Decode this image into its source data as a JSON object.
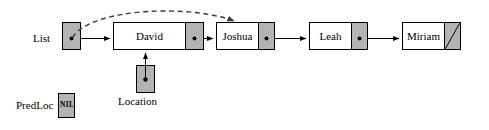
{
  "diagram": {
    "colors": {
      "fill_gray": "#b3b3b3",
      "fill_white": "#ffffff",
      "stroke": "#000000",
      "stroke_gray": "#555555",
      "background": "#ffffff"
    },
    "external_pointers": [
      {
        "id": "list",
        "label": "List",
        "value": "",
        "points_to": "david",
        "dashed_points_to": "joshua"
      },
      {
        "id": "predloc",
        "label": "PredLoc",
        "value": "NIL",
        "points_to": null
      },
      {
        "id": "location",
        "label": "Location",
        "value": "",
        "points_to": "david"
      }
    ],
    "nodes": [
      {
        "id": "david",
        "label": "David",
        "next": "joshua",
        "next_is_null": false
      },
      {
        "id": "joshua",
        "label": "Joshua",
        "next": "leah",
        "next_is_null": false
      },
      {
        "id": "leah",
        "label": "Leah",
        "next": "miriam",
        "next_is_null": false
      },
      {
        "id": "miriam",
        "label": "Miriam",
        "next": null,
        "next_is_null": true
      }
    ],
    "edges": [
      {
        "from": "list",
        "to": "david",
        "style": "solid"
      },
      {
        "from": "list",
        "to": "joshua",
        "style": "dashed"
      },
      {
        "from": "david",
        "to": "joshua",
        "style": "solid"
      },
      {
        "from": "joshua",
        "to": "leah",
        "style": "solid"
      },
      {
        "from": "leah",
        "to": "miriam",
        "style": "solid"
      },
      {
        "from": "location",
        "to": "david",
        "style": "solid"
      }
    ]
  }
}
